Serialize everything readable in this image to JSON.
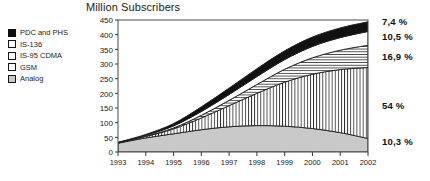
{
  "chart_data": {
    "type": "area",
    "stacked": true,
    "title": "Million Subscribers",
    "xlabel": "",
    "ylabel": "",
    "grid": false,
    "legend_position": "top-left",
    "categories": [
      1993,
      1994,
      1995,
      1996,
      1997,
      1998,
      1999,
      2000,
      2001,
      2002
    ],
    "tick_labels_x": [
      "1993",
      "1994",
      "1995",
      "1996",
      "1997",
      "1998",
      "1999",
      "2000",
      "2001",
      "2002"
    ],
    "tick_labels_y": [
      "0",
      "50",
      "100",
      "150",
      "200",
      "250",
      "300",
      "350",
      "400",
      "450"
    ],
    "ylim": [
      0,
      450
    ],
    "ytick_step": 50,
    "series": [
      {
        "name": "Analog",
        "pattern": "solid-grey",
        "color": "#c9c9c9",
        "values": [
          30,
          48,
          62,
          76,
          86,
          90,
          88,
          80,
          66,
          46
        ]
      },
      {
        "name": "GSM",
        "pattern": "vertical-stripes",
        "color": "#ffffff",
        "values": [
          1,
          5,
          17,
          40,
          72,
          110,
          150,
          185,
          215,
          242
        ]
      },
      {
        "name": "IS-95 CDMA",
        "pattern": "horizontal-stripes",
        "color": "#ffffff",
        "values": [
          0,
          1,
          3,
          9,
          18,
          30,
          44,
          56,
          66,
          76
        ]
      },
      {
        "name": "IS-136",
        "pattern": "white",
        "color": "#ffffff",
        "values": [
          1,
          3,
          7,
          13,
          20,
          27,
          33,
          39,
          43,
          47
        ]
      },
      {
        "name": "PDC and  PHS",
        "pattern": "solid-black",
        "color": "#111111",
        "values": [
          1,
          3,
          8,
          16,
          22,
          27,
          30,
          32,
          33,
          33
        ]
      }
    ],
    "annotations": [
      {
        "text": "7,4 %",
        "series": "PDC and  PHS",
        "y_px": 22
      },
      {
        "text": "10,5 %",
        "series": "IS-136",
        "y_px": 37
      },
      {
        "text": "16,9 %",
        "series": "IS-95 CDMA",
        "y_px": 57
      },
      {
        "text": "54 %",
        "series": "GSM",
        "y_px": 106
      },
      {
        "text": "10,3 %",
        "series": "Analog",
        "y_px": 142
      }
    ]
  },
  "title": "Million Subscribers",
  "legend": {
    "items": [
      {
        "label": "PDC and  PHS",
        "swatch": "solid-black-swatch"
      },
      {
        "label": "IS-136",
        "swatch": "white-swatch"
      },
      {
        "label": "IS-95 CDMA",
        "swatch": "horizontal-stripe-swatch"
      },
      {
        "label": "GSM",
        "swatch": "vertical-stripe-swatch"
      },
      {
        "label": "Analog",
        "swatch": "grey-swatch"
      }
    ]
  },
  "axes": {
    "y_ticks": [
      "450",
      "400",
      "350",
      "300",
      "250",
      "200",
      "150",
      "100",
      "50",
      "0"
    ],
    "x_ticks": [
      "1993",
      "1994",
      "1995",
      "1996",
      "1997",
      "1998",
      "1999",
      "2000",
      "2001",
      "2002"
    ]
  },
  "percent_labels": [
    "7,4 %",
    "10,5 %",
    "16,9 %",
    "54 %",
    "10,3 %"
  ]
}
